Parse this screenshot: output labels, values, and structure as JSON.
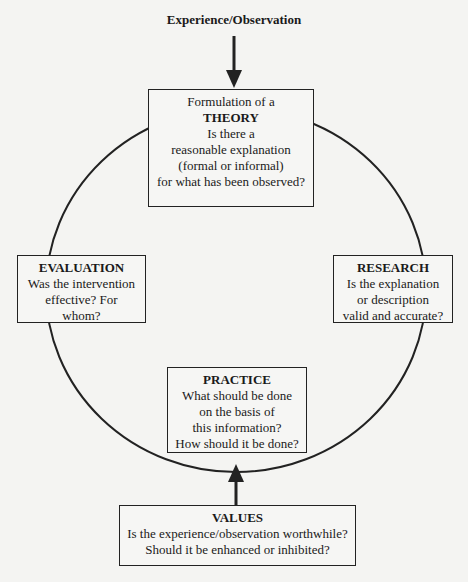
{
  "diagram": {
    "input_label": "Experience/Observation",
    "theory": {
      "intro": "Formulation of a",
      "title": "THEORY",
      "lines": [
        "Is there a",
        "reasonable explanation",
        "(formal or informal)",
        "for what has been observed?"
      ]
    },
    "research": {
      "title": "RESEARCH",
      "lines": [
        "Is the explanation",
        "or description",
        "valid and accurate?"
      ]
    },
    "practice": {
      "title": "PRACTICE",
      "lines": [
        "What should be done",
        "on the basis of",
        "this information?",
        "How should it be done?"
      ]
    },
    "evaluation": {
      "title": "EVALUATION",
      "lines": [
        "Was the intervention",
        "effective?  For",
        "whom?"
      ]
    },
    "values": {
      "title": "VALUES",
      "lines": [
        "Is the experience/observation worthwhile?",
        "Should it be enhanced or inhibited?"
      ]
    },
    "cycle_order": [
      "THEORY",
      "RESEARCH",
      "PRACTICE",
      "EVALUATION"
    ]
  }
}
